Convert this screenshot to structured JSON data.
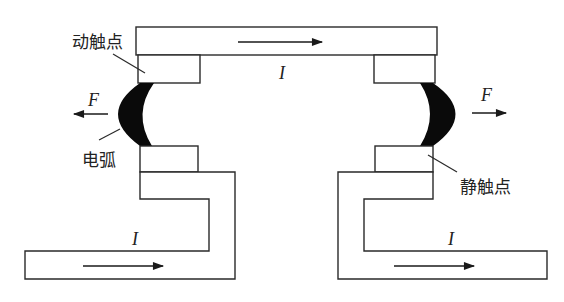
{
  "diagram": {
    "labels": {
      "moving_contact": "动触点",
      "static_contact": "静触点",
      "arc": "电弧",
      "current_top": "I",
      "current_left": "I",
      "current_right": "I",
      "force_left": "F",
      "force_right": "F"
    },
    "colors": {
      "stroke": "#2a2a2a",
      "arc_fill": "#0a0a0a",
      "background": "#ffffff"
    },
    "arrows": {
      "top_current_direction": "right",
      "bottom_left_current_direction": "right",
      "bottom_right_current_direction": "right",
      "left_force_direction": "left",
      "right_force_direction": "right"
    }
  }
}
